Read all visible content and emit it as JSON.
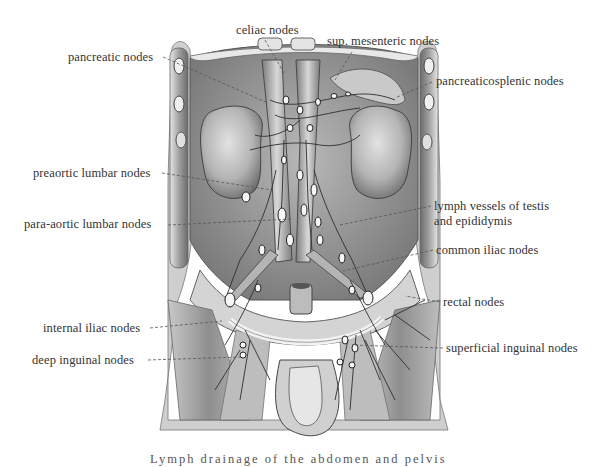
{
  "figure": {
    "type": "anatomical illustration",
    "colors": {
      "background": "#ffffff",
      "tissue_light": "#d9d9d9",
      "tissue_mid": "#a9a9a9",
      "tissue_dark": "#5e5e5e",
      "outline": "#3a3a3a",
      "node_fill": "#f4f4f4",
      "text": "#333333",
      "leader_line": "#555555"
    }
  },
  "labels": [
    {
      "id": "celiac-nodes",
      "text": "celiac nodes",
      "x": 236,
      "y": 23,
      "align": "left",
      "line": [
        [
          265,
          40
        ],
        [
          285,
          75
        ]
      ]
    },
    {
      "id": "sup-mesenteric-nodes",
      "text": "sup. mesenteric nodes",
      "x": 327,
      "y": 34,
      "align": "left",
      "line": [
        [
          352,
          52
        ],
        [
          335,
          80
        ]
      ]
    },
    {
      "id": "pancreatic-nodes",
      "text": "pancreatic nodes",
      "x": 68,
      "y": 50,
      "align": "left",
      "line": [
        [
          163,
          57
        ],
        [
          268,
          103
        ]
      ]
    },
    {
      "id": "pancreaticosplenic-nodes",
      "text": "pancreaticosplenic nodes",
      "x": 436,
      "y": 74,
      "align": "left",
      "line": [
        [
          432,
          82
        ],
        [
          395,
          98
        ]
      ]
    },
    {
      "id": "preaortic-lumbar-nodes",
      "text": "preaortic lumbar nodes",
      "x": 33,
      "y": 166,
      "align": "left",
      "line": [
        [
          162,
          173
        ],
        [
          272,
          190
        ]
      ]
    },
    {
      "id": "para-aortic-lumbar-nodes",
      "text": "para-aortic lumbar nodes",
      "x": 24,
      "y": 217,
      "align": "left",
      "line": [
        [
          168,
          225
        ],
        [
          292,
          219
        ]
      ]
    },
    {
      "id": "lymph-vessels-testis",
      "text": "lymph vessels of testis",
      "text2": "and epididymis",
      "x": 434,
      "y": 199,
      "align": "left",
      "line": [
        [
          431,
          206
        ],
        [
          340,
          225
        ]
      ]
    },
    {
      "id": "common-iliac-nodes",
      "text": "common iliac nodes",
      "x": 436,
      "y": 243,
      "align": "left",
      "line": [
        [
          433,
          250
        ],
        [
          343,
          271
        ]
      ]
    },
    {
      "id": "rectal-nodes",
      "text": "rectal nodes",
      "x": 443,
      "y": 295,
      "align": "left",
      "line": [
        [
          440,
          302
        ],
        [
          405,
          296
        ]
      ]
    },
    {
      "id": "internal-iliac-nodes",
      "text": "internal iliac nodes",
      "x": 43,
      "y": 321,
      "align": "left",
      "line": [
        [
          150,
          328
        ],
        [
          222,
          321
        ]
      ]
    },
    {
      "id": "deep-inguinal-nodes",
      "text": "deep inguinal nodes",
      "x": 32,
      "y": 353,
      "align": "left",
      "line": [
        [
          148,
          360
        ],
        [
          243,
          357
        ]
      ]
    },
    {
      "id": "superficial-inguinal-nodes",
      "text": "superficial inguinal nodes",
      "x": 446,
      "y": 341,
      "align": "left",
      "line": [
        [
          443,
          348
        ],
        [
          352,
          345
        ]
      ]
    }
  ],
  "caption": {
    "text": "Lymph drainage of the abdomen and pelvis",
    "visible": "partially cut off at bottom edge"
  }
}
